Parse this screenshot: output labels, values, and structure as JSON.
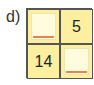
{
  "label": "d)",
  "grid": {
    "cells": [
      {
        "type": "blank",
        "value": ""
      },
      {
        "type": "number",
        "value": "5"
      },
      {
        "type": "number",
        "value": "14"
      },
      {
        "type": "blank",
        "value": ""
      }
    ]
  },
  "colors": {
    "cell_bg": "#fcf0a0",
    "blank_bg": "#fffbdc",
    "underline": "#e8834a",
    "border": "#555555"
  }
}
